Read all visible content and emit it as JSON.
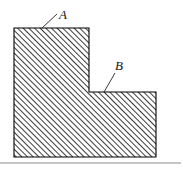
{
  "figure": {
    "kind": "hatched-cross-section-diagram",
    "background_color": "#ffffff",
    "outline_color": "#000000",
    "hatch_color": "#1a1a1a",
    "hatch_angle_deg": 45,
    "hatch_spacing_px": 4,
    "ground_line_color": "#8d8d8d",
    "shape": {
      "name": "L-shaped-section",
      "polygon_points": "14,28 89,28 89,92 156,92 156,157 14,157",
      "vertices": [
        {
          "x": 14,
          "y": 28
        },
        {
          "x": 89,
          "y": 28
        },
        {
          "x": 89,
          "y": 92
        },
        {
          "x": 156,
          "y": 92
        },
        {
          "x": 156,
          "y": 157
        },
        {
          "x": 14,
          "y": 157
        }
      ]
    },
    "ground_line": {
      "x1": 0,
      "y1": 163,
      "x2": 181,
      "y2": 163
    },
    "labels": [
      {
        "id": "A",
        "text": "A",
        "text_x": 59,
        "text_y": 19,
        "leader": {
          "x1": 42,
          "y1": 28,
          "x2": 57,
          "y2": 14
        }
      },
      {
        "id": "B",
        "text": "B",
        "text_x": 115,
        "text_y": 70,
        "leader": {
          "x1": 104,
          "y1": 92,
          "x2": 115,
          "y2": 73
        }
      }
    ]
  }
}
